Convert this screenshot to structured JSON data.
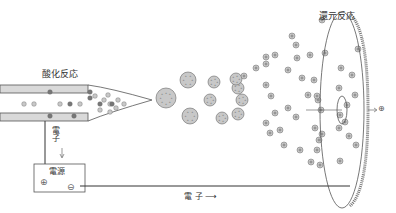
{
  "labels": {
    "oxidation": "酸化反応",
    "reduction": "還元反応",
    "electron_vertical": "電子",
    "electron_bottom": "電 子 ⟶",
    "power_source": "電源",
    "plus_terminal": "⊕",
    "minus_terminal": "⊖"
  },
  "colors": {
    "line": "#444444",
    "tube_fill": "#d9d9d9",
    "particle_fill": "#c8c8c8",
    "particle_dark": "#777777",
    "particle_stroke": "#666666"
  },
  "large_droplets": [
    [
      166,
      98,
      10
    ],
    [
      188,
      80,
      8
    ],
    [
      190,
      116,
      8
    ],
    [
      210,
      100,
      6
    ],
    [
      214,
      82,
      6
    ],
    [
      222,
      118,
      6
    ],
    [
      238,
      88,
      6
    ],
    [
      238,
      114,
      6
    ],
    [
      236,
      79,
      6
    ],
    [
      242,
      100,
      6
    ]
  ],
  "ions": [
    [
      244,
      76
    ],
    [
      256,
      68
    ],
    [
      266,
      64
    ],
    [
      266,
      85
    ],
    [
      271,
      96
    ],
    [
      275,
      113
    ],
    [
      266,
      123
    ],
    [
      270,
      133
    ],
    [
      280,
      130
    ],
    [
      284,
      145
    ],
    [
      296,
      117
    ],
    [
      288,
      108
    ],
    [
      308,
      95
    ],
    [
      302,
      78
    ],
    [
      297,
      58
    ],
    [
      266,
      57
    ],
    [
      296,
      45
    ],
    [
      275,
      55
    ],
    [
      318,
      100
    ],
    [
      317,
      150
    ],
    [
      315,
      128
    ],
    [
      322,
      134
    ],
    [
      311,
      162
    ],
    [
      300,
      150
    ],
    [
      321,
      110
    ],
    [
      319,
      140
    ],
    [
      292,
      36
    ],
    [
      322,
      20
    ],
    [
      325,
      53
    ],
    [
      314,
      80
    ],
    [
      317,
      96
    ],
    [
      347,
      105
    ],
    [
      340,
      115
    ],
    [
      345,
      122
    ],
    [
      339,
      128
    ],
    [
      349,
      136
    ],
    [
      340,
      161
    ],
    [
      356,
      145
    ],
    [
      341,
      68
    ],
    [
      339,
      88
    ],
    [
      358,
      49
    ],
    [
      320,
      165
    ],
    [
      352,
      75
    ],
    [
      355,
      95
    ],
    [
      310,
      55
    ],
    [
      288,
      70
    ]
  ],
  "tube_particles": [
    [
      24,
      104,
      "light"
    ],
    [
      34,
      104,
      "light"
    ],
    [
      50,
      92,
      "dark"
    ],
    [
      60,
      104,
      "light"
    ],
    [
      70,
      104,
      "dark"
    ],
    [
      80,
      104,
      "light"
    ],
    [
      90,
      92,
      "dark"
    ],
    [
      100,
      104,
      "dark"
    ],
    [
      110,
      104,
      "light"
    ],
    [
      50,
      116,
      "dark"
    ],
    [
      74,
      116,
      "dark"
    ],
    [
      90,
      98,
      "dark"
    ],
    [
      95,
      96,
      "light"
    ],
    [
      104,
      100,
      "light"
    ],
    [
      108,
      95,
      "light"
    ],
    [
      112,
      104,
      "dark"
    ],
    [
      118,
      100,
      "light"
    ],
    [
      124,
      104,
      "light"
    ],
    [
      100,
      110,
      "light"
    ],
    [
      110,
      112,
      "light"
    ],
    [
      116,
      108,
      "light"
    ]
  ]
}
